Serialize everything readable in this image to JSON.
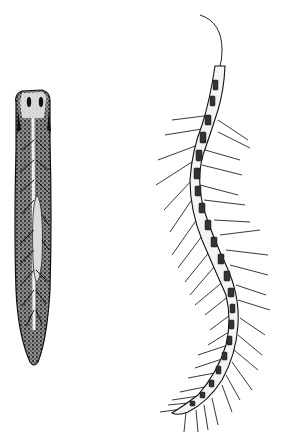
{
  "figure": {
    "caption_fragment": "",
    "specimens": [
      {
        "id": "flatworm",
        "label": "planarian flatworm illustration"
      },
      {
        "id": "bristle-worm",
        "label": "bristle worm (polychaete) illustration"
      }
    ],
    "colors": {
      "background": "#ffffff",
      "ink": "#1a1a1a",
      "stipple": "#2b2b2b",
      "light": "#f2f2f2"
    }
  }
}
